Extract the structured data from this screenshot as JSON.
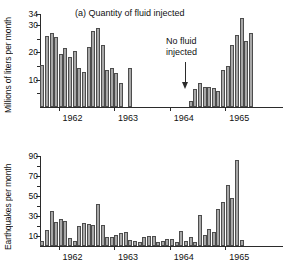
{
  "figure": {
    "arrow_icon": "down-arrow-icon"
  },
  "annotation": {
    "line1": "No fluid",
    "line2": "injected"
  },
  "chart_data": [
    {
      "type": "bar",
      "panel": "a",
      "title": "(a) Quantity of fluid injected",
      "xlabel": "",
      "ylabel": "Millions of liters per month",
      "ylim": [
        0,
        34
      ],
      "yticks": [
        10,
        20,
        30,
        34
      ],
      "yminor": [
        5,
        15,
        25
      ],
      "grid": false,
      "legend": false,
      "xlim": [
        "1961-09",
        "1965-12"
      ],
      "xtick_labels": [
        "1962",
        "1963",
        "1964",
        "1965"
      ],
      "xtick_positions": [
        "1962-01",
        "1963-01",
        "1964-01",
        "1965-01"
      ],
      "x": [
        "1961-09",
        "1961-10",
        "1961-11",
        "1961-12",
        "1962-01",
        "1962-02",
        "1962-03",
        "1962-04",
        "1962-05",
        "1962-06",
        "1962-07",
        "1962-08",
        "1962-09",
        "1962-10",
        "1962-11",
        "1962-12",
        "1963-01",
        "1963-02",
        "1963-03",
        "1963-04",
        "1963-05",
        "1963-06",
        "1963-07",
        "1963-08",
        "1963-09",
        "1963-10",
        "1963-11",
        "1963-12",
        "1964-01",
        "1964-02",
        "1964-03",
        "1964-04",
        "1964-05",
        "1964-06",
        "1964-07",
        "1964-08",
        "1964-09",
        "1964-10",
        "1964-11",
        "1964-12",
        "1965-01",
        "1965-02",
        "1965-03",
        "1965-04",
        "1965-05",
        "1965-06",
        "1965-07",
        "1965-08",
        "1965-09"
      ],
      "values": [
        15.3,
        26.0,
        26.9,
        25.6,
        19.4,
        21.7,
        18.2,
        20.3,
        14.1,
        12.8,
        21.9,
        27.8,
        28.9,
        22.7,
        13.4,
        14.2,
        12.4,
        8.8,
        0,
        14.3,
        0,
        0,
        0,
        0,
        0,
        0,
        0,
        0,
        0,
        0,
        0,
        0,
        2.2,
        6.6,
        8.9,
        7.5,
        7.3,
        6.9,
        5.7,
        13.4,
        14.9,
        22.7,
        26.2,
        32.6,
        24.0,
        26.9,
        0,
        0,
        0
      ]
    },
    {
      "type": "bar",
      "panel": "b",
      "title": "(b) Number of earthquakes per month",
      "xlabel": "",
      "ylabel": "Earthquakes per month",
      "ylim": [
        0,
        90
      ],
      "yticks": [
        10,
        30,
        50,
        70,
        90
      ],
      "yminor": [
        20,
        40,
        60,
        80
      ],
      "grid": false,
      "legend": false,
      "xlim": [
        "1961-09",
        "1965-12"
      ],
      "xtick_labels": [
        "1962",
        "1963",
        "1964",
        "1965"
      ],
      "xtick_positions": [
        "1962-01",
        "1963-01",
        "1964-01",
        "1965-01"
      ],
      "x": [
        "1961-09",
        "1961-10",
        "1961-11",
        "1961-12",
        "1962-01",
        "1962-02",
        "1962-03",
        "1962-04",
        "1962-05",
        "1962-06",
        "1962-07",
        "1962-08",
        "1962-09",
        "1962-10",
        "1962-11",
        "1962-12",
        "1963-01",
        "1963-02",
        "1963-03",
        "1963-04",
        "1963-05",
        "1963-06",
        "1963-07",
        "1963-08",
        "1963-09",
        "1963-10",
        "1963-11",
        "1963-12",
        "1964-01",
        "1964-02",
        "1964-03",
        "1964-04",
        "1964-05",
        "1964-06",
        "1964-07",
        "1964-08",
        "1964-09",
        "1964-10",
        "1964-11",
        "1964-12",
        "1965-01",
        "1965-02",
        "1965-03",
        "1965-04",
        "1965-05",
        "1965-06",
        "1965-07",
        "1965-08",
        "1965-09"
      ],
      "values": [
        5,
        16,
        35,
        24,
        27,
        25,
        8,
        5,
        20,
        23,
        22,
        21,
        42,
        21,
        9,
        9,
        11,
        13,
        14,
        6,
        5,
        4,
        9,
        10,
        10,
        4,
        5,
        7,
        7,
        4,
        15,
        5,
        9,
        4,
        31,
        11,
        17,
        14,
        37,
        44,
        61,
        48,
        86,
        6,
        0,
        0,
        0,
        0,
        0
      ]
    }
  ]
}
